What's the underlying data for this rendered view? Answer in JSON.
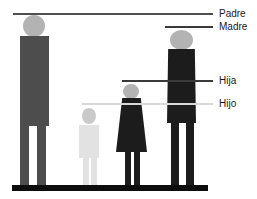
{
  "diagram": {
    "background_color": "#ffffff",
    "ground_color": "#0d0d0d",
    "callouts": [
      {
        "label": "Padre",
        "line_color": "#4f4f4f",
        "line_y_px": 13
      },
      {
        "label": "Madre",
        "line_color": "#3a3a3a",
        "line_y_px": 26
      },
      {
        "label": "Hija",
        "line_color": "#3a3a3a",
        "line_y_px": 80
      },
      {
        "label": "Hijo",
        "line_color": "#d8d8d8",
        "line_y_px": 103
      }
    ],
    "figures": [
      {
        "name": "padre",
        "position": "far-left",
        "body_color": "#4d4d4d",
        "head_color": "#b3b3b3",
        "relative_height_px": 170
      },
      {
        "name": "hijo",
        "position": "center-left",
        "body_color": "#e2e2e2",
        "head_color": "#c9c9c9",
        "relative_height_px": 77
      },
      {
        "name": "hija",
        "position": "center-right",
        "body_color": "#1c1c1c",
        "head_color": "#b3b3b3",
        "relative_height_px": 101
      },
      {
        "name": "madre",
        "position": "far-right",
        "body_color": "#1c1c1c",
        "head_color": "#b3b3b3",
        "relative_height_px": 155
      }
    ]
  }
}
